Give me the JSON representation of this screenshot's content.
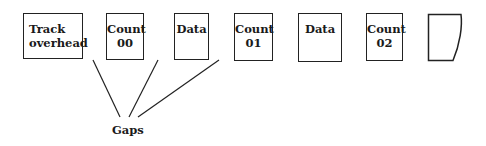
{
  "diagram": {
    "type": "track-layout",
    "boxes": [
      {
        "id": "track-overhead",
        "line1": "Track",
        "line2": "overhead",
        "x": 23,
        "y": 13,
        "w": 60,
        "h": 46
      },
      {
        "id": "count-00",
        "line1": "Count",
        "line2": "00",
        "x": 106,
        "y": 13,
        "w": 38,
        "h": 47
      },
      {
        "id": "data-1",
        "line1": "Data",
        "line2": "",
        "x": 174,
        "y": 13,
        "w": 35,
        "h": 47
      },
      {
        "id": "count-01",
        "line1": "Count",
        "line2": "01",
        "x": 234,
        "y": 13,
        "w": 39,
        "h": 48
      },
      {
        "id": "data-2",
        "line1": "Data",
        "line2": "",
        "x": 298,
        "y": 13,
        "w": 44,
        "h": 49
      },
      {
        "id": "count-02",
        "line1": "Count",
        "line2": "02",
        "x": 366,
        "y": 13,
        "w": 37,
        "h": 48
      },
      {
        "id": "partial-record",
        "line1": "",
        "line2": "",
        "x": 428,
        "y": 14,
        "w": 34,
        "h": 47,
        "partial": true
      }
    ],
    "gaps_label": "Gaps",
    "connectors": [
      {
        "from": "gap-track-overhead-count-00",
        "x1": 93,
        "y1": 60,
        "x2": 120,
        "y2": 117
      },
      {
        "from": "gap-count-00-data",
        "x1": 158,
        "y1": 60,
        "x2": 129,
        "y2": 117
      },
      {
        "from": "gap-data-count-01",
        "x1": 219,
        "y1": 60,
        "x2": 138,
        "y2": 117
      }
    ],
    "stroke_color": "#222222",
    "background": "#ffffff"
  }
}
